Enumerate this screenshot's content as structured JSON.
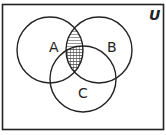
{
  "diagram": {
    "type": "venn",
    "universe_label": "U",
    "sets": [
      {
        "label": "A"
      },
      {
        "label": "B"
      },
      {
        "label": "C"
      }
    ],
    "shaded_regions": [
      {
        "region": "A∩B (outside C)",
        "pattern": "horizontal-lines"
      },
      {
        "region": "A∩B∩C",
        "pattern": "crosshatch"
      }
    ],
    "colors": {
      "stroke": "#222222",
      "background": "#ffffff"
    }
  }
}
